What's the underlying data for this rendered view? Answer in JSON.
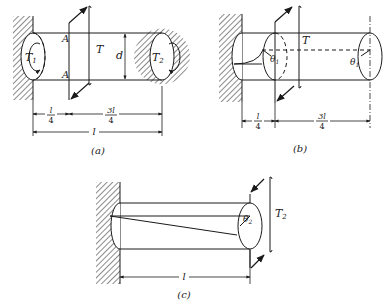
{
  "figure": {
    "panels": [
      {
        "id": "a",
        "caption": "(a)",
        "labels": {
          "T1": "T",
          "T1_sub": "1",
          "T2": "T",
          "T2_sub": "2",
          "T": "T",
          "A_top": "A",
          "A_bottom": "A",
          "d": "d",
          "dim_left_num": "l",
          "dim_left_den": "4",
          "dim_right_num": "3l",
          "dim_right_den": "4",
          "dim_total": "l"
        }
      },
      {
        "id": "b",
        "caption": "(b)",
        "labels": {
          "T": "T",
          "theta_mid": "θ",
          "theta_mid_sub": "1",
          "theta_end": "θ",
          "theta_end_sub": "1",
          "dim_left_num": "l",
          "dim_left_den": "4",
          "dim_right_num": "3l",
          "dim_right_den": "4"
        }
      },
      {
        "id": "c",
        "caption": "(c)",
        "labels": {
          "T2": "T",
          "T2_sub": "2",
          "theta": "θ",
          "theta_sub": "2",
          "dim_total": "l"
        }
      }
    ]
  }
}
